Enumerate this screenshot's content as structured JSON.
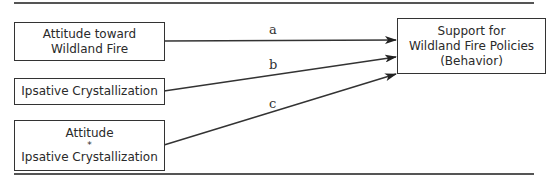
{
  "diagram": {
    "type": "path-model",
    "nodes": {
      "attitude": {
        "lines": [
          "Attitude toward",
          "Wildland Fire"
        ]
      },
      "ipsative": {
        "lines": [
          "Ipsative Crystallization"
        ]
      },
      "interaction": {
        "lines": [
          "Attitude",
          "*",
          "Ipsative Crystallization"
        ]
      },
      "outcome": {
        "lines": [
          "Support for",
          "Wildland Fire Policies",
          "(Behavior)"
        ]
      }
    },
    "edges": [
      {
        "from": "attitude",
        "to": "outcome",
        "label": "a"
      },
      {
        "from": "ipsative",
        "to": "outcome",
        "label": "b"
      },
      {
        "from": "interaction",
        "to": "outcome",
        "label": "c"
      }
    ],
    "colors": {
      "line": "#333333",
      "rule": "#555555",
      "background": "#ffffff"
    }
  }
}
